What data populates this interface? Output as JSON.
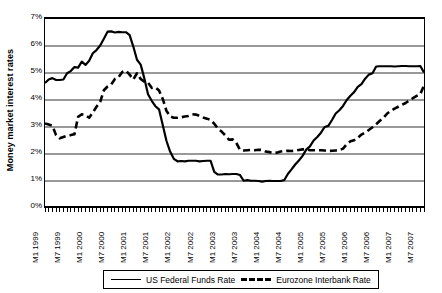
{
  "chart_data": {
    "type": "line",
    "title": "",
    "xlabel": "",
    "ylabel": "Money market interest rates",
    "ylim": [
      0,
      7
    ],
    "ytick_labels": [
      "7%",
      "6%",
      "5%",
      "4%",
      "3%",
      "2%",
      "1%",
      "0%"
    ],
    "ytick_values": [
      7,
      6,
      5,
      4,
      3,
      2,
      1,
      0
    ],
    "grid": true,
    "grid_orientation": "horizontal",
    "legend_position": "bottom",
    "x_tick_labels": [
      "M1 1999",
      "M7 1999",
      "M1 2000",
      "M7 2000",
      "M1 2001",
      "M7 2001",
      "M1 2002",
      "M7 2002",
      "M1 2003",
      "M7 2003",
      "M1 2004",
      "M7 2004",
      "M1 2005",
      "M7 2005",
      "M1 2006",
      "M7 2006",
      "M1 2007",
      "M7 2007"
    ],
    "x_months": [
      "M1 1999",
      "M2 1999",
      "M3 1999",
      "M4 1999",
      "M5 1999",
      "M6 1999",
      "M7 1999",
      "M8 1999",
      "M9 1999",
      "M10 1999",
      "M11 1999",
      "M12 1999",
      "M1 2000",
      "M2 2000",
      "M3 2000",
      "M4 2000",
      "M5 2000",
      "M6 2000",
      "M7 2000",
      "M8 2000",
      "M9 2000",
      "M10 2000",
      "M11 2000",
      "M12 2000",
      "M1 2001",
      "M2 2001",
      "M3 2001",
      "M4 2001",
      "M5 2001",
      "M6 2001",
      "M7 2001",
      "M8 2001",
      "M9 2001",
      "M10 2001",
      "M11 2001",
      "M12 2001",
      "M1 2002",
      "M2 2002",
      "M3 2002",
      "M4 2002",
      "M5 2002",
      "M6 2002",
      "M7 2002",
      "M8 2002",
      "M9 2002",
      "M10 2002",
      "M11 2002",
      "M12 2002",
      "M1 2003",
      "M2 2003",
      "M3 2003",
      "M4 2003",
      "M5 2003",
      "M6 2003",
      "M7 2003",
      "M8 2003",
      "M9 2003",
      "M10 2003",
      "M11 2003",
      "M12 2003",
      "M1 2004",
      "M2 2004",
      "M3 2004",
      "M4 2004",
      "M5 2004",
      "M6 2004",
      "M7 2004",
      "M8 2004",
      "M9 2004",
      "M10 2004",
      "M11 2004",
      "M12 2004",
      "M1 2005",
      "M2 2005",
      "M3 2005",
      "M4 2005",
      "M5 2005",
      "M6 2005",
      "M7 2005",
      "M8 2005",
      "M9 2005",
      "M10 2005",
      "M11 2005",
      "M12 2005",
      "M1 2006",
      "M2 2006",
      "M3 2006",
      "M4 2006",
      "M5 2006",
      "M6 2006",
      "M7 2006",
      "M8 2006",
      "M9 2006",
      "M10 2006",
      "M11 2006",
      "M12 2006",
      "M1 2007",
      "M2 2007",
      "M3 2007",
      "M4 2007",
      "M5 2007",
      "M6 2007",
      "M7 2007",
      "M8 2007"
    ],
    "series": [
      {
        "name": "US Federal Funds Rate",
        "style": "solid",
        "color": "#000000",
        "values": [
          4.63,
          4.76,
          4.81,
          4.74,
          4.74,
          4.76,
          4.99,
          5.07,
          5.22,
          5.2,
          5.42,
          5.3,
          5.45,
          5.73,
          5.85,
          6.02,
          6.27,
          6.53,
          6.54,
          6.5,
          6.52,
          6.51,
          6.51,
          6.4,
          5.98,
          5.49,
          5.31,
          4.8,
          4.21,
          3.97,
          3.77,
          3.65,
          3.07,
          2.49,
          2.09,
          1.82,
          1.73,
          1.74,
          1.73,
          1.75,
          1.75,
          1.75,
          1.73,
          1.74,
          1.75,
          1.75,
          1.34,
          1.24,
          1.24,
          1.26,
          1.25,
          1.26,
          1.26,
          1.22,
          1.01,
          1.03,
          1.01,
          1.01,
          1.0,
          0.98,
          1.0,
          1.01,
          1.0,
          1.0,
          1.0,
          1.03,
          1.26,
          1.43,
          1.61,
          1.76,
          1.93,
          2.16,
          2.28,
          2.5,
          2.63,
          2.79,
          3.0,
          3.04,
          3.26,
          3.5,
          3.62,
          3.78,
          4.0,
          4.16,
          4.29,
          4.49,
          4.59,
          4.79,
          4.94,
          4.99,
          5.24,
          5.25,
          5.25,
          5.25,
          5.25,
          5.24,
          5.25,
          5.26,
          5.26,
          5.25,
          5.25,
          5.25,
          5.26,
          5.02
        ]
      },
      {
        "name": "Eurozone Interbank Rate",
        "style": "dashed",
        "color": "#000000",
        "values": [
          3.13,
          3.09,
          3.05,
          2.7,
          2.58,
          2.63,
          2.68,
          2.7,
          2.73,
          3.38,
          3.47,
          3.44,
          3.34,
          3.54,
          3.75,
          3.93,
          4.36,
          4.5,
          4.58,
          4.78,
          4.85,
          5.04,
          5.09,
          4.94,
          4.76,
          4.99,
          4.78,
          4.68,
          4.64,
          4.45,
          4.47,
          4.35,
          4.04,
          3.6,
          3.39,
          3.34,
          3.34,
          3.36,
          3.39,
          3.41,
          3.47,
          3.46,
          3.41,
          3.35,
          3.31,
          3.26,
          3.12,
          2.94,
          2.83,
          2.69,
          2.53,
          2.54,
          2.41,
          2.15,
          2.13,
          2.14,
          2.15,
          2.14,
          2.16,
          2.15,
          2.09,
          2.07,
          2.03,
          2.05,
          2.09,
          2.11,
          2.12,
          2.11,
          2.12,
          2.15,
          2.17,
          2.17,
          2.14,
          2.14,
          2.14,
          2.14,
          2.13,
          2.11,
          2.12,
          2.13,
          2.14,
          2.2,
          2.36,
          2.47,
          2.51,
          2.6,
          2.72,
          2.79,
          2.89,
          2.99,
          3.1,
          3.23,
          3.34,
          3.5,
          3.6,
          3.68,
          3.75,
          3.82,
          3.89,
          3.98,
          4.07,
          4.15,
          4.22,
          4.54
        ]
      }
    ]
  },
  "legend": {
    "entries": [
      {
        "label": "US Federal Funds Rate",
        "style": "solid"
      },
      {
        "label": "Eurozone Interbank Rate",
        "style": "dashed"
      }
    ]
  }
}
